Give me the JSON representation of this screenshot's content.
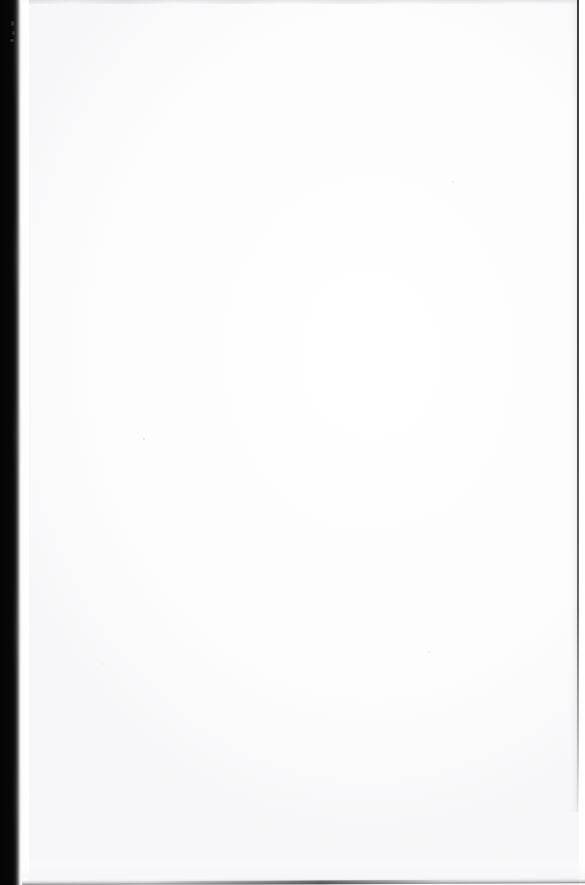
{
  "document": {
    "kind": "scanned-page",
    "content_type": "blank",
    "page_text": "",
    "visible_text_lines": [],
    "caption": "Blank scanned page"
  },
  "canvas": {
    "width_px": 585,
    "height_px": 885,
    "paper_color": "#ffffff",
    "background_color": "#ffffff"
  },
  "artifacts": {
    "binding_gutter": {
      "name": "left-binding-gutter",
      "edge": "left",
      "x_px": 0,
      "width_px": 22,
      "color": "#050505",
      "falloff_color": "#b8b8b8"
    },
    "top_edge": {
      "name": "top-page-edge-band",
      "edge": "top",
      "y_px": 0,
      "height_px": 5,
      "color": "#e4e4e7"
    },
    "right_line": {
      "name": "right-scan-line",
      "edge": "right",
      "x_px": 577,
      "width_px": 2,
      "height_px": 812,
      "color": "#303030"
    },
    "bottom_edge": {
      "name": "bottom-page-edge-shadow",
      "edge": "bottom",
      "height_px": 7,
      "color": "#606064",
      "tilt_deg": -0.18
    }
  },
  "blemishes": [
    {
      "x_px": 143,
      "y_px": 438,
      "size_px": 2,
      "color": "rgba(205,205,210,0.55)"
    },
    {
      "x_px": 452,
      "y_px": 181,
      "size_px": 2,
      "color": "rgba(212,212,216,0.45)"
    },
    {
      "x_px": 428,
      "y_px": 651,
      "size_px": 2,
      "color": "rgba(215,215,219,0.40)"
    },
    {
      "x_px": 102,
      "y_px": 663,
      "size_px": 2,
      "color": "rgba(218,218,222,0.35)"
    },
    {
      "x_px": 519,
      "y_px": 253,
      "size_px": 1,
      "color": "rgba(220,220,224,0.40)"
    }
  ],
  "gutter_specks": [
    {
      "x_px": 11,
      "y_px": 21,
      "w_px": 3,
      "h_px": 5
    },
    {
      "x_px": 12,
      "y_px": 31,
      "w_px": 3,
      "h_px": 4
    },
    {
      "x_px": 10,
      "y_px": 39,
      "w_px": 4,
      "h_px": 3
    }
  ]
}
